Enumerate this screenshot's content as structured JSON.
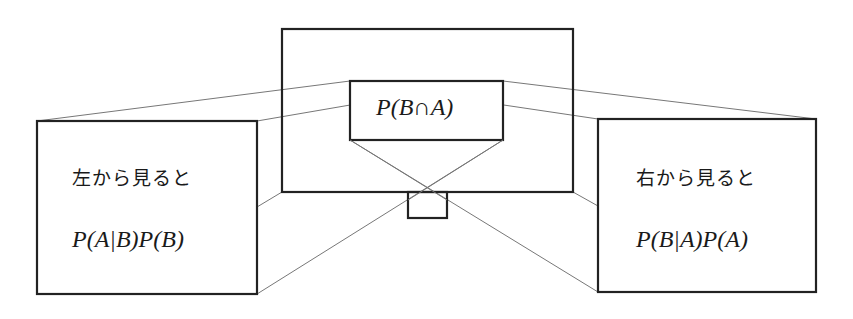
{
  "diagram": {
    "center": {
      "formula": "P(B∩A)"
    },
    "left_view": {
      "caption": "左から見ると",
      "formula": "P(A|B)P(B)"
    },
    "right_view": {
      "caption": "右から見ると",
      "formula": "P(B|A)P(A)"
    },
    "colors": {
      "box_stroke": "#222222",
      "projection_lines": "#777777",
      "background": "#ffffff"
    }
  }
}
